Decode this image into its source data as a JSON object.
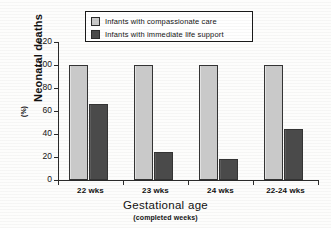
{
  "chart_data": {
    "type": "bar",
    "title": "",
    "categories": [
      "22 wks",
      "23 wks",
      "24 wks",
      "22-24 wks"
    ],
    "series": [
      {
        "name": "Infants with compassionate care",
        "color": "#c9c9c9",
        "values": [
          100,
          100,
          100,
          100
        ]
      },
      {
        "name": "Infants with immediate life support",
        "color": "#4a4a4a",
        "values": [
          66,
          24,
          18,
          44
        ]
      }
    ],
    "xlabel": "Gestational age",
    "xsublabel": "(completed weeks)",
    "ylabel": "Neonatal deaths",
    "yunit": "(%)",
    "ylim": [
      0,
      120
    ],
    "yticks": [
      0,
      20,
      40,
      60,
      80,
      100,
      120
    ],
    "ytick_labels": [
      "0",
      "20",
      "40",
      "60",
      "80",
      "100",
      "120"
    ],
    "grid": false,
    "legend_position": "top-center"
  },
  "legend": {
    "items": [
      {
        "label": "Infants with compassionate care",
        "swatch": "light"
      },
      {
        "label": "Infants with immediate life support",
        "swatch": "dark"
      }
    ]
  }
}
